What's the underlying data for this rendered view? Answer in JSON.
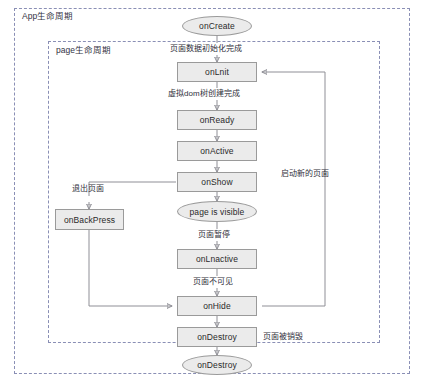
{
  "diagram": {
    "title_app_group": "App生命周期",
    "title_page_group": "page生命周期"
  },
  "nodes": {
    "on_create": "onCreate",
    "on_init": "onLnit",
    "on_ready": "onReady",
    "on_active": "onActive",
    "on_show": "onShow",
    "page_is_visible": "page is visible",
    "on_inactive": "onLnactive",
    "on_hide": "onHide",
    "on_destroy_box": "onDestroy",
    "on_destroy_oval": "onDestroy",
    "on_back_press": "onBackPress"
  },
  "edge_labels": {
    "data_init_done": "页面数据初始化完成",
    "vdom_created": "虚拟dom树创建完成",
    "page_paused": "页面暂停",
    "page_invisible": "页面不可见",
    "exit_page": "退出页面",
    "launch_new_page": "启动新的页面",
    "page_destroyed": "页面被销毁"
  },
  "colors": {
    "node_fill": "#ebebeb",
    "node_border": "#9a9a9a",
    "group_border": "#8a8fb5",
    "wire": "#8f8f96",
    "text": "#2a2a2a"
  }
}
